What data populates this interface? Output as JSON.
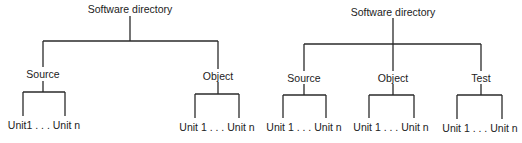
{
  "diagrams": [
    {
      "root": "Software directory",
      "children": [
        {
          "label": "Source",
          "leaves": "Unit1 . . . Unit n"
        },
        {
          "label": "Object",
          "leaves": "Unit 1 . . . Unit n"
        }
      ]
    },
    {
      "root": "Software directory",
      "children": [
        {
          "label": "Source",
          "leaves": "Unit 1 . . . Unit n"
        },
        {
          "label": "Object",
          "leaves": "Unit 1 . . . Unit n"
        },
        {
          "label": "Test",
          "leaves": "Unit 1 . . . Unit n"
        }
      ]
    }
  ],
  "colors": {
    "line": "#2a2a2a",
    "text": "#222222",
    "background": "#ffffff"
  }
}
